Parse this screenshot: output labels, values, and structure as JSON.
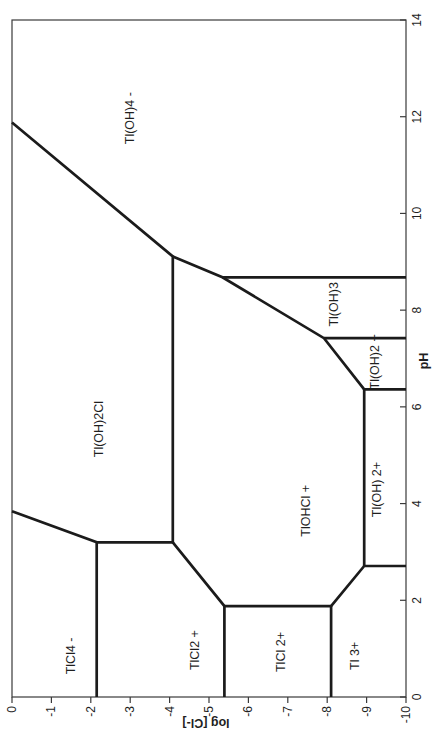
{
  "page": {
    "background": "#ffffff"
  },
  "chart_data": {
    "type": "line",
    "variant": "predominance-area-diagram",
    "title": "",
    "xlabel": "pH",
    "ylabel": "log [Cl-]",
    "xlim": [
      0,
      14
    ],
    "ylim": [
      -10,
      0
    ],
    "x_ticks": [
      0,
      2,
      4,
      6,
      8,
      10,
      12,
      14
    ],
    "y_ticks": [
      0,
      -1,
      -2,
      -3,
      -4,
      -5,
      -6,
      -7,
      -8,
      -9,
      -10
    ],
    "grid": false,
    "legend": "none",
    "rotated_ccw_deg": 90,
    "line_color": "#1b1b1b",
    "frame_color": "#3a3a3a",
    "text_color": "#1f1f1f",
    "boundaries": [
      {
        "name": "TlCl4-sep",
        "points": [
          [
            0,
            -2.15
          ],
          [
            3.2,
            -2.15
          ],
          [
            3.84,
            0
          ]
        ]
      },
      {
        "name": "Tl(OH)2Cl-sep",
        "points": [
          [
            3.2,
            -2.15
          ],
          [
            3.2,
            -4.08
          ],
          [
            9.11,
            -4.08
          ],
          [
            11.88,
            0
          ]
        ]
      },
      {
        "name": "TlCl2-sep",
        "points": [
          [
            3.2,
            -4.08
          ],
          [
            1.88,
            -5.39
          ],
          [
            0,
            -5.39
          ]
        ]
      },
      {
        "name": "TlCl-2p-sep",
        "points": [
          [
            1.88,
            -5.39
          ],
          [
            1.88,
            -8.1
          ],
          [
            0,
            -8.1
          ]
        ]
      },
      {
        "name": "Tl3p-sep",
        "points": [
          [
            1.88,
            -8.1
          ],
          [
            2.71,
            -8.94
          ],
          [
            2.71,
            -10
          ]
        ]
      },
      {
        "name": "TlOH-2p-sep",
        "points": [
          [
            2.71,
            -8.94
          ],
          [
            6.36,
            -8.94
          ],
          [
            6.36,
            -10
          ]
        ]
      },
      {
        "name": "hydrolysis-diagonal",
        "points": [
          [
            9.11,
            -4.08
          ],
          [
            8.68,
            -5.34
          ],
          [
            7.42,
            -7.92
          ],
          [
            6.36,
            -8.94
          ]
        ]
      },
      {
        "name": "Tl(OH)3-upper",
        "points": [
          [
            8.68,
            -5.34
          ],
          [
            8.68,
            -10
          ]
        ]
      },
      {
        "name": "Tl(OH)3-lower",
        "points": [
          [
            7.42,
            -7.92
          ],
          [
            7.42,
            -10
          ]
        ]
      }
    ],
    "regions": [
      {
        "label": "TlCl4 -",
        "at": [
          0.85,
          -1.5
        ],
        "polygon": [
          [
            0,
            0
          ],
          [
            3.84,
            0
          ],
          [
            3.2,
            -2.15
          ],
          [
            0,
            -2.15
          ]
        ]
      },
      {
        "label": "TlCl2 +",
        "at": [
          0.97,
          -4.64
        ],
        "polygon": [
          [
            0,
            -2.15
          ],
          [
            3.2,
            -2.15
          ],
          [
            3.2,
            -4.08
          ],
          [
            1.88,
            -5.39
          ],
          [
            0,
            -5.39
          ]
        ]
      },
      {
        "label": "TlCl 2+",
        "at": [
          0.93,
          -6.83
        ],
        "polygon": [
          [
            0,
            -5.39
          ],
          [
            1.88,
            -5.39
          ],
          [
            1.88,
            -8.1
          ],
          [
            0,
            -8.1
          ]
        ]
      },
      {
        "label": "Tl 3+",
        "at": [
          0.85,
          -8.71
        ],
        "polygon": [
          [
            0,
            -8.1
          ],
          [
            1.88,
            -8.1
          ],
          [
            2.71,
            -8.94
          ],
          [
            2.71,
            -10
          ],
          [
            0,
            -10
          ]
        ]
      },
      {
        "label": "Tl(OH)2Cl",
        "at": [
          5.54,
          -2.2
        ],
        "polygon": [
          [
            3.84,
            0
          ],
          [
            11.88,
            0
          ],
          [
            9.11,
            -4.08
          ],
          [
            3.2,
            -4.08
          ],
          [
            3.2,
            -2.15
          ]
        ]
      },
      {
        "label": "TlOHCl +",
        "at": [
          3.85,
          -7.46
        ],
        "polygon": [
          [
            3.2,
            -4.08
          ],
          [
            9.11,
            -4.08
          ],
          [
            8.68,
            -5.34
          ],
          [
            7.42,
            -7.92
          ],
          [
            6.36,
            -8.94
          ],
          [
            2.71,
            -8.94
          ],
          [
            1.88,
            -8.1
          ],
          [
            1.88,
            -5.39
          ]
        ]
      },
      {
        "label": "Tl(OH) 2+",
        "at": [
          4.29,
          -9.26
        ],
        "polygon": [
          [
            2.71,
            -8.94
          ],
          [
            6.36,
            -8.94
          ],
          [
            6.36,
            -10
          ],
          [
            2.71,
            -10
          ]
        ]
      },
      {
        "label": "Tl(OH)2 +",
        "at": [
          6.93,
          -9.22
        ],
        "polygon": [
          [
            6.36,
            -8.94
          ],
          [
            7.42,
            -7.92
          ],
          [
            7.42,
            -10
          ],
          [
            6.36,
            -10
          ]
        ]
      },
      {
        "label": "Tl(OH)3",
        "at": [
          8.12,
          -8.17
        ],
        "polygon": [
          [
            7.42,
            -7.92
          ],
          [
            8.68,
            -5.34
          ],
          [
            8.68,
            -10
          ],
          [
            7.42,
            -10
          ]
        ]
      },
      {
        "label": "Tl(OH)4 -",
        "at": [
          11.97,
          -2.99
        ],
        "polygon": [
          [
            11.88,
            0
          ],
          [
            14,
            0
          ],
          [
            14,
            -10
          ],
          [
            8.68,
            -10
          ],
          [
            8.68,
            -5.34
          ],
          [
            9.11,
            -4.08
          ]
        ]
      }
    ]
  }
}
